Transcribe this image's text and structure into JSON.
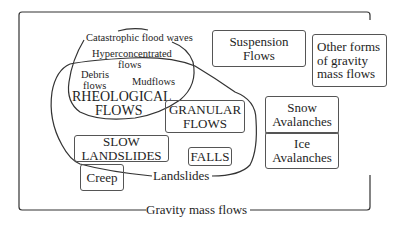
{
  "diagram": {
    "outer_label": "Gravity mass flows",
    "landslides_label": "Landslides",
    "rheological": {
      "title_line1": "RHEOLOGICAL",
      "title_line2": "FLOWS",
      "members": {
        "catastrophic": "Catastrophic flood waves",
        "hyper_line1": "Hyperconcentrated",
        "hyper_line2": "flows",
        "debris_line1": "Debris",
        "debris_line2": "flows",
        "mudflows": "Mudflows"
      }
    },
    "boxes": {
      "suspension_line1": "Suspension",
      "suspension_line2": "Flows",
      "other_line1": "Other forms",
      "other_line2": "of gravity",
      "other_line3": "mass flows",
      "snow_line1": "Snow",
      "snow_line2": "Avalanches",
      "ice_line1": "Ice",
      "ice_line2": "Avalanches",
      "granular_line1": "GRANULAR",
      "granular_line2": "FLOWS",
      "slow_line1": "SLOW",
      "slow_line2": "LANDSLIDES",
      "falls": "FALLS",
      "creep": "Creep"
    }
  }
}
